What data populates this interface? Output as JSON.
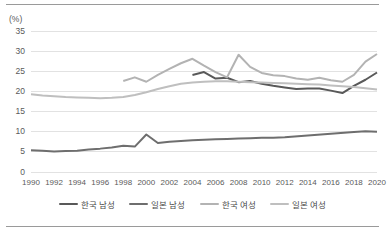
{
  "chart_data": {
    "type": "line",
    "title": "",
    "subtitle": "",
    "xlabel": "",
    "ylabel": "(%)",
    "unit_label": "(%)",
    "grid": true,
    "legend_position": "bottom",
    "xlim": [
      1990,
      2020
    ],
    "ylim": [
      0,
      35
    ],
    "yticks": [
      0,
      5,
      10,
      15,
      20,
      25,
      30,
      35
    ],
    "ytick_labels": [
      "0",
      "5",
      "10",
      "15",
      "20",
      "25",
      "30",
      "35"
    ],
    "x": [
      1990,
      1991,
      1992,
      1993,
      1994,
      1995,
      1996,
      1997,
      1998,
      1999,
      2000,
      2001,
      2002,
      2003,
      2004,
      2005,
      2006,
      2007,
      2008,
      2009,
      2010,
      2011,
      2012,
      2013,
      2014,
      2015,
      2016,
      2017,
      2018,
      2019,
      2020
    ],
    "xtick_labels": [
      "1990",
      "1992",
      "1994",
      "1996",
      "1998",
      "2000",
      "2002",
      "2004",
      "2006",
      "2008",
      "2010",
      "2012",
      "2014",
      "2016",
      "2018",
      "2020"
    ],
    "series": [
      {
        "name": "한국 남성",
        "color": "#595959",
        "width": 2.0,
        "x": [
          2004,
          2005,
          2006,
          2007,
          2008,
          2009,
          2010,
          2011,
          2012,
          2013,
          2014,
          2015,
          2016,
          2017,
          2018,
          2019,
          2020
        ],
        "values": [
          24.1,
          24.8,
          23.2,
          23.4,
          22.3,
          22.6,
          21.9,
          21.4,
          21.0,
          20.6,
          20.7,
          20.7,
          20.2,
          19.6,
          21.4,
          22.9,
          24.7
        ]
      },
      {
        "name": "일본 남성",
        "color": "#6e6e6e",
        "width": 2.0,
        "x": [
          1990,
          1991,
          1992,
          1993,
          1994,
          1995,
          1996,
          1997,
          1998,
          1999,
          2000,
          2001,
          2002,
          2003,
          2004,
          2005,
          2006,
          2007,
          2008,
          2009,
          2010,
          2011,
          2012,
          2018,
          2019,
          2020
        ],
        "values": [
          5.4,
          5.3,
          5.1,
          5.2,
          5.3,
          5.6,
          5.8,
          6.1,
          6.5,
          6.3,
          9.3,
          7.2,
          7.5,
          7.7,
          7.9,
          8.0,
          8.1,
          8.2,
          8.3,
          8.4,
          8.5,
          8.5,
          8.6,
          9.9,
          10.1,
          10.0
        ]
      },
      {
        "name": "한국 여성",
        "color": "#b3b3b3",
        "width": 2.0,
        "x": [
          1998,
          1999,
          2000,
          2001,
          2002,
          2003,
          2004,
          2005,
          2006,
          2007,
          2008,
          2009,
          2010,
          2011,
          2012,
          2013,
          2014,
          2015,
          2016,
          2017,
          2018,
          2019,
          2020
        ],
        "values": [
          22.6,
          23.5,
          22.4,
          24.1,
          25.6,
          27.0,
          28.1,
          26.4,
          24.8,
          23.5,
          29.1,
          26.1,
          24.6,
          24.0,
          23.8,
          23.2,
          22.9,
          23.4,
          22.8,
          22.4,
          24.1,
          27.4,
          29.3
        ]
      },
      {
        "name": "일본 여성",
        "color": "#bfbfbf",
        "width": 2.0,
        "x": [
          1990,
          1991,
          1992,
          1993,
          1994,
          1995,
          1996,
          1997,
          1998,
          1999,
          2000,
          2001,
          2002,
          2003,
          2004,
          2005,
          2006,
          2007,
          2008,
          2009,
          2010,
          2011,
          2012,
          2013,
          2014,
          2015,
          2016,
          2017,
          2018,
          2019,
          2020
        ],
        "values": [
          19.3,
          19.0,
          18.8,
          18.6,
          18.5,
          18.4,
          18.3,
          18.4,
          18.6,
          19.1,
          19.8,
          20.6,
          21.3,
          21.9,
          22.2,
          22.4,
          22.5,
          22.5,
          22.4,
          22.3,
          22.2,
          22.1,
          22.0,
          21.9,
          21.8,
          21.7,
          21.5,
          21.3,
          21.1,
          20.8,
          20.5
        ]
      }
    ]
  },
  "legend": {
    "items": [
      {
        "label": "한국 남성",
        "color": "#595959"
      },
      {
        "label": "일본 남성",
        "color": "#6e6e6e"
      },
      {
        "label": "한국 여성",
        "color": "#b3b3b3"
      },
      {
        "label": "일본 여성",
        "color": "#bfbfbf"
      }
    ]
  }
}
